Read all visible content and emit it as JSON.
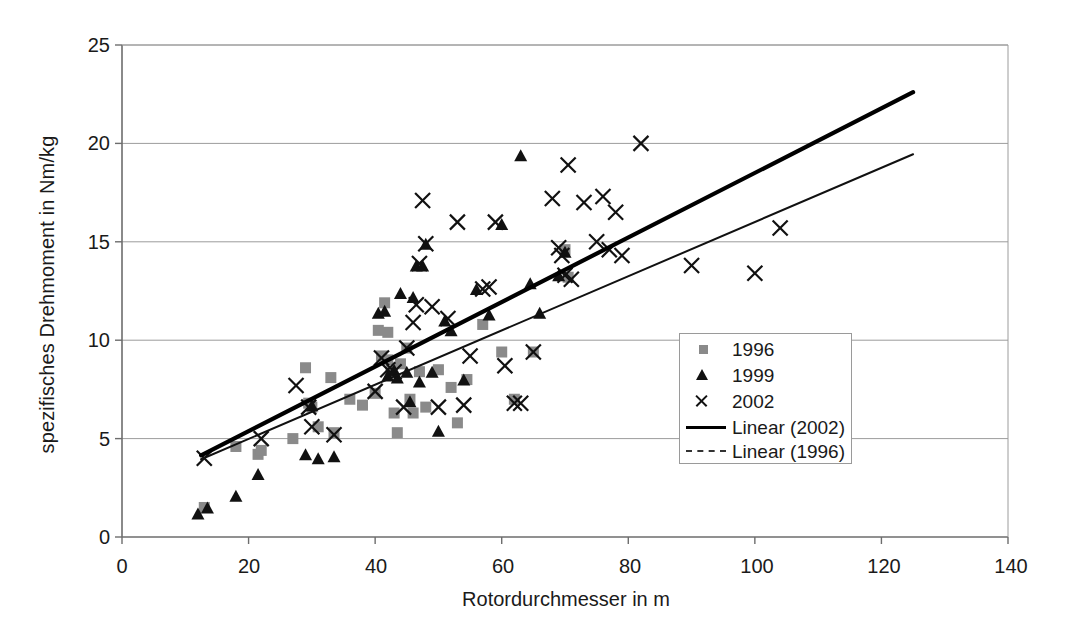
{
  "chart_data": {
    "type": "scatter",
    "title": "",
    "xlabel": "Rotordurchmesser in m",
    "ylabel": "spezifisches Drehmoment in Nm/kg",
    "xlim": [
      0,
      140
    ],
    "ylim": [
      0,
      25
    ],
    "xticks": [
      0,
      20,
      40,
      60,
      80,
      100,
      120,
      140
    ],
    "yticks": [
      0,
      5,
      10,
      15,
      20,
      25
    ],
    "grid": "horizontal",
    "legend_position": "center-right",
    "legend": [
      "1996",
      "1999",
      "2002",
      "Linear (2002)",
      "Linear (1996)"
    ],
    "series": [
      {
        "name": "1996",
        "marker": "square",
        "color": "#8a8a8a",
        "points": [
          [
            13.0,
            1.5
          ],
          [
            18.0,
            4.6
          ],
          [
            21.5,
            4.2
          ],
          [
            22.0,
            4.4
          ],
          [
            27.0,
            5.0
          ],
          [
            29.0,
            8.6
          ],
          [
            29.5,
            6.8
          ],
          [
            30.0,
            6.6
          ],
          [
            31.0,
            5.6
          ],
          [
            33.0,
            8.1
          ],
          [
            33.5,
            5.3
          ],
          [
            36.0,
            7.0
          ],
          [
            38.0,
            6.7
          ],
          [
            40.0,
            7.3
          ],
          [
            40.5,
            10.5
          ],
          [
            41.0,
            9.2
          ],
          [
            41.5,
            11.9
          ],
          [
            42.0,
            10.4
          ],
          [
            42.0,
            9.0
          ],
          [
            42.5,
            8.4
          ],
          [
            43.0,
            6.3
          ],
          [
            43.5,
            5.3
          ],
          [
            44.0,
            8.8
          ],
          [
            45.0,
            9.6
          ],
          [
            45.5,
            7.0
          ],
          [
            46.0,
            6.3
          ],
          [
            47.0,
            8.4
          ],
          [
            48.0,
            6.6
          ],
          [
            50.0,
            8.5
          ],
          [
            52.0,
            7.6
          ],
          [
            53.0,
            5.8
          ],
          [
            54.5,
            8.0
          ],
          [
            57.0,
            10.8
          ],
          [
            60.0,
            9.4
          ],
          [
            62.0,
            7.0
          ],
          [
            65.0,
            9.4
          ],
          [
            70.0,
            14.6
          ],
          [
            70.5,
            13.2
          ]
        ]
      },
      {
        "name": "1999",
        "marker": "triangle",
        "color": "#111111",
        "points": [
          [
            12.0,
            1.2
          ],
          [
            13.5,
            1.5
          ],
          [
            18.0,
            2.1
          ],
          [
            21.5,
            3.2
          ],
          [
            29.0,
            4.2
          ],
          [
            30.0,
            6.7
          ],
          [
            31.0,
            4.0
          ],
          [
            33.5,
            4.1
          ],
          [
            40.5,
            11.4
          ],
          [
            41.5,
            11.5
          ],
          [
            42.0,
            8.2
          ],
          [
            43.0,
            8.5
          ],
          [
            43.5,
            8.1
          ],
          [
            44.0,
            12.4
          ],
          [
            45.0,
            8.4
          ],
          [
            45.5,
            6.9
          ],
          [
            46.0,
            12.2
          ],
          [
            46.5,
            13.8
          ],
          [
            47.0,
            7.9
          ],
          [
            47.5,
            13.8
          ],
          [
            48.0,
            14.9
          ],
          [
            49.0,
            8.4
          ],
          [
            50.0,
            5.4
          ],
          [
            51.0,
            11.0
          ],
          [
            52.0,
            10.5
          ],
          [
            54.0,
            8.0
          ],
          [
            56.0,
            12.6
          ],
          [
            58.0,
            11.3
          ],
          [
            60.0,
            15.9
          ],
          [
            63.0,
            19.4
          ],
          [
            64.5,
            12.9
          ],
          [
            66.0,
            11.4
          ],
          [
            69.0,
            13.3
          ],
          [
            70.0,
            14.5
          ]
        ]
      },
      {
        "name": "2002",
        "marker": "cross",
        "color": "#111111",
        "points": [
          [
            13.0,
            4.0
          ],
          [
            22.0,
            5.0
          ],
          [
            27.5,
            7.7
          ],
          [
            29.5,
            6.6
          ],
          [
            30.0,
            5.6
          ],
          [
            33.5,
            5.2
          ],
          [
            40.0,
            7.4
          ],
          [
            41.0,
            9.1
          ],
          [
            42.0,
            8.5
          ],
          [
            43.0,
            8.4
          ],
          [
            44.5,
            6.6
          ],
          [
            45.0,
            9.6
          ],
          [
            46.0,
            10.9
          ],
          [
            46.5,
            11.8
          ],
          [
            47.0,
            13.9
          ],
          [
            47.5,
            17.1
          ],
          [
            48.0,
            14.9
          ],
          [
            49.0,
            11.7
          ],
          [
            50.0,
            6.6
          ],
          [
            51.5,
            11.1
          ],
          [
            53.0,
            16.0
          ],
          [
            54.0,
            6.7
          ],
          [
            55.0,
            9.2
          ],
          [
            57.0,
            12.6
          ],
          [
            58.0,
            12.7
          ],
          [
            59.0,
            16.0
          ],
          [
            60.5,
            8.7
          ],
          [
            62.0,
            6.8
          ],
          [
            63.0,
            6.8
          ],
          [
            65.0,
            9.4
          ],
          [
            68.0,
            17.2
          ],
          [
            69.0,
            14.7
          ],
          [
            69.5,
            14.3
          ],
          [
            70.0,
            13.3
          ],
          [
            70.5,
            18.9
          ],
          [
            71.0,
            13.1
          ],
          [
            73.0,
            17.0
          ],
          [
            75.0,
            15.0
          ],
          [
            76.0,
            17.3
          ],
          [
            77.0,
            14.6
          ],
          [
            78.0,
            16.5
          ],
          [
            79.0,
            14.3
          ],
          [
            82.0,
            20.0
          ],
          [
            90.0,
            13.8
          ],
          [
            100.0,
            13.4
          ],
          [
            104.0,
            15.7
          ]
        ]
      }
    ],
    "trendlines": [
      {
        "name": "Linear (2002)",
        "style": "solid",
        "color": "#000000",
        "x_start": 12.5,
        "y_start": 4.15,
        "x_end": 125.0,
        "y_end": 22.6
      },
      {
        "name": "Linear (1996)",
        "style": "solid-thin",
        "color": "#111111",
        "x_start": 12.5,
        "y_start": 3.95,
        "x_end": 125.0,
        "y_end": 19.45
      }
    ]
  },
  "axis": {
    "y_label": "spezifisches Drehmoment in Nm/kg",
    "x_label": "Rotordurchmesser in m",
    "y_ticks": [
      "0",
      "5",
      "10",
      "15",
      "20",
      "25"
    ],
    "x_ticks": [
      "0",
      "20",
      "40",
      "60",
      "80",
      "100",
      "120",
      "140"
    ]
  },
  "legend": {
    "entries": [
      {
        "label": "1996",
        "icon": "square-marker-icon"
      },
      {
        "label": "1999",
        "icon": "triangle-marker-icon"
      },
      {
        "label": "2002",
        "icon": "cross-marker-icon"
      },
      {
        "label": "Linear (2002)",
        "icon": "solid-line-icon"
      },
      {
        "label": "Linear (1996)",
        "icon": "dashed-line-icon"
      }
    ]
  }
}
